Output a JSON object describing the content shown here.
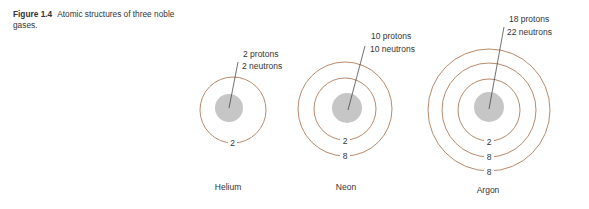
{
  "caption": {
    "figure_number": "Figure 1.4",
    "text": "Atomic structures of three noble gases."
  },
  "colors": {
    "shell": "#b98a6c",
    "nucleus": "#c6c6c6",
    "leader_line": "#333333",
    "text": "#333333"
  },
  "atoms": [
    {
      "name": "Helium",
      "nucleus_label_1": "2 protons",
      "nucleus_label_2": "2 neutrons",
      "shells": [
        "2"
      ]
    },
    {
      "name": "Neon",
      "nucleus_label_1": "10 protons",
      "nucleus_label_2": "10 neutrons",
      "shells": [
        "2",
        "8"
      ]
    },
    {
      "name": "Argon",
      "nucleus_label_1": "18 protons",
      "nucleus_label_2": "22 neutrons",
      "shells": [
        "2",
        "8",
        "8"
      ]
    }
  ]
}
